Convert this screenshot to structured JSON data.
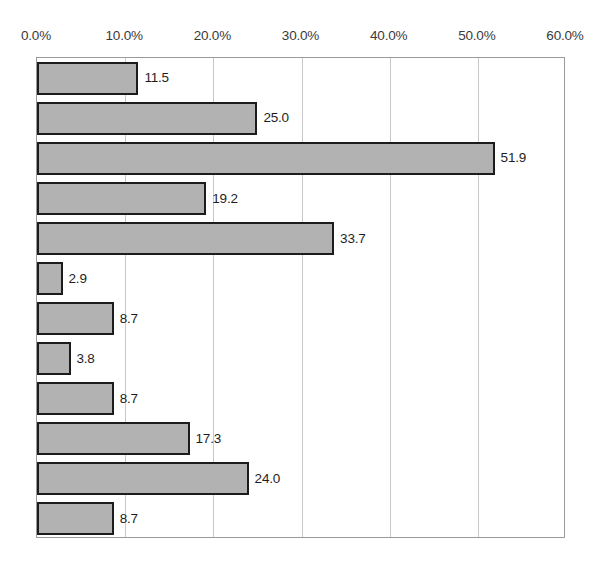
{
  "chart_data": {
    "type": "bar",
    "orientation": "horizontal",
    "title": "",
    "subtitle": "",
    "xlabel": "",
    "ylabel": "",
    "xlim": [
      0,
      60
    ],
    "ylim": null,
    "grid": true,
    "legend": null,
    "legend_position": "none",
    "axis_position": "top",
    "categories": [
      "",
      "",
      "",
      "",
      "",
      "",
      "",
      "",
      "",
      "",
      "",
      ""
    ],
    "values": [
      11.5,
      25.0,
      51.9,
      19.2,
      33.7,
      2.9,
      8.7,
      3.8,
      8.7,
      17.3,
      24.0,
      8.7
    ],
    "data_labels": [
      "11.5",
      "25.0",
      "51.9",
      "19.2",
      "33.7",
      "2.9",
      "8.7",
      "3.8",
      "8.7",
      "17.3",
      "24.0",
      "8.7"
    ],
    "x_ticks": [
      0,
      10,
      20,
      30,
      40,
      50,
      60
    ],
    "x_tick_labels": [
      "0.0%",
      "10.0%",
      "20.0%",
      "30.0%",
      "40.0%",
      "50.0%",
      "60.0%"
    ],
    "colors": {
      "bar_fill": "#b2b2b2",
      "bar_border": "#1c1c1c",
      "gridline": "#c9c9c9",
      "frame": "#9a9a9a",
      "label_text": "#1e1e1e",
      "tick_text": "#3a3a3a",
      "background": "#ffffff"
    }
  }
}
